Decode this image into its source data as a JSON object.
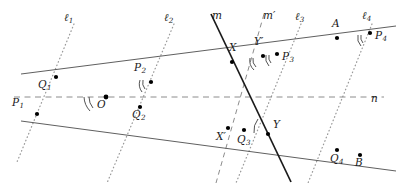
{
  "figure": {
    "width": 399,
    "height": 186,
    "background": "#ffffff"
  },
  "colors": {
    "solid_gray": "#4d4d4d",
    "solid_black": "#1a1a1a",
    "dotted_gray": "#9a9a9a",
    "dashed_gray": "#8c8c8c",
    "point_fill": "#000000",
    "label_color": "#1a1a1a"
  },
  "labels": {
    "l1": "ℓ",
    "l1_sub": "1",
    "l2": "ℓ",
    "l2_sub": "2",
    "l3": "ℓ",
    "l3_sub": "3",
    "l4": "ℓ",
    "l4_sub": "4",
    "m": "m",
    "m_prime": "m′",
    "n": "n",
    "O": "O",
    "P1": "P",
    "P1_sub": "1",
    "P2": "P",
    "P2_sub": "2",
    "P3": "P",
    "P3_sub": "3",
    "P4": "P",
    "P4_sub": "4",
    "Q1": "Q",
    "Q1_sub": "1",
    "Q2": "Q",
    "Q2_sub": "2",
    "Q3": "Q",
    "Q3_sub": "3",
    "Q4": "Q",
    "Q4_sub": "4",
    "X": "X",
    "X_prime": "X′",
    "Y": "Y",
    "Y_prime": "Y′",
    "A": "A",
    "B": "B"
  },
  "geometry": {
    "points": [
      {
        "name": "Q1",
        "x": 56,
        "y": 77,
        "label_x": 40,
        "label_y": 80
      },
      {
        "name": "P1",
        "x": 37,
        "y": 114,
        "label_x": 14,
        "label_y": 98
      },
      {
        "name": "O",
        "x": 106,
        "y": 97,
        "label_x": 99,
        "label_y": 99
      },
      {
        "name": "P2",
        "x": 151,
        "y": 82,
        "label_x": 136,
        "label_y": 64
      },
      {
        "name": "Q2",
        "x": 140,
        "y": 107,
        "label_x": 134,
        "label_y": 110
      },
      {
        "name": "X",
        "x": 232,
        "y": 62,
        "label_x": 230,
        "label_y": 44
      },
      {
        "name": "Yp",
        "x": 262,
        "y": 56,
        "label_x": 256,
        "label_y": 38
      },
      {
        "name": "P3",
        "x": 277,
        "y": 53,
        "label_x": 283,
        "label_y": 52
      },
      {
        "name": "A",
        "x": 337,
        "y": 38,
        "label_x": 332,
        "label_y": 20
      },
      {
        "name": "P4",
        "x": 370,
        "y": 33,
        "label_x": 375,
        "label_y": 31
      },
      {
        "name": "Xp",
        "x": 228,
        "y": 128,
        "label_x": 219,
        "label_y": 133
      },
      {
        "name": "Q3",
        "x": 244,
        "y": 131,
        "label_x": 238,
        "label_y": 136
      },
      {
        "name": "Y",
        "x": 268,
        "y": 136,
        "label_x": 273,
        "label_y": 121
      },
      {
        "name": "Q4",
        "x": 337,
        "y": 150,
        "label_x": 331,
        "label_y": 155
      },
      {
        "name": "B",
        "x": 360,
        "y": 155,
        "label_x": 355,
        "label_y": 159
      }
    ],
    "lines": [
      {
        "name": "line-OA-upper",
        "style": "solid",
        "x1": 22,
        "y1": 75,
        "x2": 395,
        "y2": 27
      },
      {
        "name": "line-OB-lower",
        "style": "solid",
        "x1": 22,
        "y1": 120,
        "x2": 395,
        "y2": 170
      },
      {
        "name": "line-n",
        "style": "dashed",
        "x1": 16,
        "y1": 97,
        "x2": 385,
        "y2": 97
      },
      {
        "name": "line-m",
        "style": "solid-black",
        "x1": 212,
        "y1": 15,
        "x2": 290,
        "y2": 180
      },
      {
        "name": "line-m-prime",
        "style": "dashed",
        "x1": 263,
        "y1": 15,
        "x2": 218,
        "y2": 180
      },
      {
        "name": "line-l1",
        "style": "dotted",
        "x1": 73,
        "y1": 25,
        "x2": 18,
        "y2": 160
      },
      {
        "name": "line-l2",
        "style": "dotted",
        "x1": 173,
        "y1": 25,
        "x2": 108,
        "y2": 180
      },
      {
        "name": "line-l3",
        "style": "dotted",
        "x1": 300,
        "y1": 25,
        "x2": 238,
        "y2": 180
      },
      {
        "name": "line-l4",
        "style": "dotted",
        "x1": 371,
        "y1": 25,
        "x2": 310,
        "y2": 180
      }
    ],
    "line_labels": [
      {
        "name": "l1",
        "x": 66,
        "y": 13
      },
      {
        "name": "l2",
        "x": 166,
        "y": 13
      },
      {
        "name": "m",
        "x": 213,
        "y": 11
      },
      {
        "name": "mp",
        "x": 265,
        "y": 11
      },
      {
        "name": "l3",
        "x": 296,
        "y": 12
      },
      {
        "name": "l4",
        "x": 363,
        "y": 11
      },
      {
        "name": "n",
        "x": 372,
        "y": 94
      }
    ],
    "angle_marks": [
      {
        "name": "angle-at-O-P1",
        "cx": 106,
        "cy": 97,
        "note": "double-arc between line n and lower-left ray"
      },
      {
        "name": "angle-at-P2",
        "cx": 151,
        "cy": 82,
        "note": "double-arc with l2 direction"
      },
      {
        "name": "angle-at-Yprime",
        "cx": 262,
        "cy": 56,
        "note": "double-arc between m-prime and upper line"
      },
      {
        "name": "angle-at-P3",
        "cx": 277,
        "cy": 53,
        "note": "double-arc with l3"
      },
      {
        "name": "angle-at-P4",
        "cx": 370,
        "cy": 33,
        "note": "double-arc with l4"
      },
      {
        "name": "angle-at-Y",
        "cx": 268,
        "cy": 136,
        "note": "single-arc between m and lower line"
      }
    ]
  }
}
